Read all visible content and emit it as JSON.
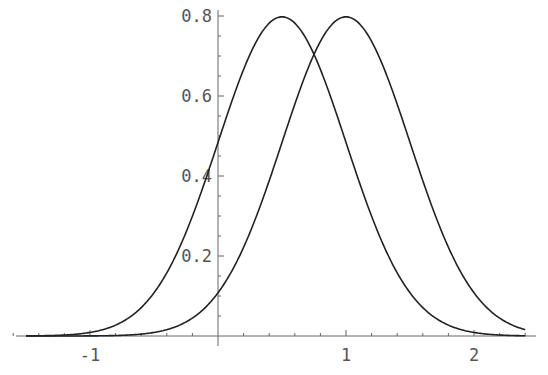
{
  "chart_data": {
    "type": "line",
    "title": "",
    "xlabel": "",
    "ylabel": "",
    "xlim": [
      -1.7,
      2.4
    ],
    "ylim": [
      0,
      0.82
    ],
    "grid": false,
    "legend": null,
    "x_ticks": [
      -1,
      1,
      2
    ],
    "x_tick_labels": [
      "-1",
      "1",
      "2"
    ],
    "y_ticks": [
      0.2,
      0.4,
      0.6,
      0.8
    ],
    "y_tick_labels": [
      "0.2",
      "0.4",
      "0.6",
      "0.8"
    ],
    "series": [
      {
        "name": "Normal(mean 0.5, sd 0.5)",
        "mean": 0.5,
        "sd": 0.5,
        "peak": 0.8,
        "x": [
          -1.5,
          -1,
          -0.5,
          0,
          0.25,
          0.5,
          0.75,
          1,
          1.5,
          2,
          2.4
        ],
        "values": [
          0.0003,
          0.0089,
          0.0864,
          0.4839,
          0.7041,
          0.7979,
          0.7041,
          0.4839,
          0.108,
          0.0089,
          0.0006
        ]
      },
      {
        "name": "Normal(mean 1, sd 0.5)",
        "mean": 1.0,
        "sd": 0.5,
        "peak": 0.8,
        "x": [
          -1.5,
          -1,
          -0.5,
          0,
          0.5,
          0.75,
          1,
          1.25,
          1.5,
          2,
          2.4
        ],
        "values": [
          0.0,
          0.0003,
          0.0089,
          0.108,
          0.4839,
          0.7041,
          0.7979,
          0.7041,
          0.4839,
          0.108,
          0.016
        ]
      }
    ]
  }
}
